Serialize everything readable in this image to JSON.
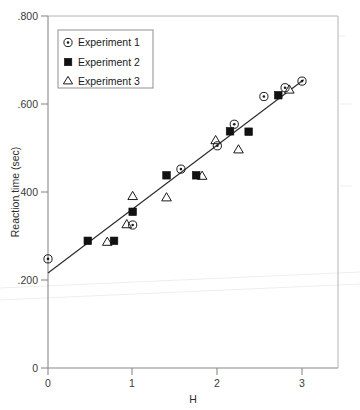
{
  "figure": {
    "width": 360,
    "height": 410,
    "background": "#ffffff"
  },
  "chart_data": {
    "type": "scatter",
    "title": "",
    "xlabel": "H",
    "ylabel": "Reaction time (sec)",
    "xlim": [
      0,
      3.4
    ],
    "ylim": [
      0,
      0.8
    ],
    "xticks": [
      0,
      1,
      2,
      3
    ],
    "xticklabels": [
      "0",
      "1",
      "2",
      "3"
    ],
    "yticks": [
      0,
      0.2,
      0.4,
      0.6,
      0.8
    ],
    "yticklabels": [
      "0",
      ".200",
      ".400",
      ".600",
      ".800"
    ],
    "grid": false,
    "legend_position": "upper-left",
    "trendline": {
      "x": [
        0,
        3.02
      ],
      "y": [
        0.216,
        0.655
      ],
      "slope": 0.1453,
      "intercept": 0.216
    },
    "series": [
      {
        "name": "Experiment 1",
        "marker": "circle-dot",
        "color": "#1a1a1a",
        "points": [
          {
            "x": 0.0,
            "y": 0.248
          },
          {
            "x": 1.0,
            "y": 0.325
          },
          {
            "x": 1.57,
            "y": 0.452
          },
          {
            "x": 2.0,
            "y": 0.505
          },
          {
            "x": 2.2,
            "y": 0.554
          },
          {
            "x": 2.55,
            "y": 0.617
          },
          {
            "x": 2.8,
            "y": 0.637
          },
          {
            "x": 3.0,
            "y": 0.652
          }
        ]
      },
      {
        "name": "Experiment 2",
        "marker": "filled-square",
        "color": "#111111",
        "points": [
          {
            "x": 0.47,
            "y": 0.289
          },
          {
            "x": 0.78,
            "y": 0.289
          },
          {
            "x": 1.0,
            "y": 0.355
          },
          {
            "x": 1.4,
            "y": 0.438
          },
          {
            "x": 1.75,
            "y": 0.438
          },
          {
            "x": 2.15,
            "y": 0.538
          },
          {
            "x": 2.37,
            "y": 0.537
          },
          {
            "x": 2.72,
            "y": 0.62
          }
        ]
      },
      {
        "name": "Experiment 3",
        "marker": "open-triangle",
        "color": "#1a1a1a",
        "points": [
          {
            "x": 0.7,
            "y": 0.287
          },
          {
            "x": 0.93,
            "y": 0.327
          },
          {
            "x": 1.0,
            "y": 0.391
          },
          {
            "x": 1.4,
            "y": 0.388
          },
          {
            "x": 1.82,
            "y": 0.437
          },
          {
            "x": 1.98,
            "y": 0.518
          },
          {
            "x": 2.25,
            "y": 0.497
          },
          {
            "x": 2.85,
            "y": 0.633
          }
        ]
      }
    ]
  },
  "legend": {
    "entries": [
      {
        "label": "Experiment 1",
        "marker": "circle-dot"
      },
      {
        "label": "Experiment 2",
        "marker": "filled-square"
      },
      {
        "label": "Experiment 3",
        "marker": "open-triangle"
      }
    ]
  }
}
